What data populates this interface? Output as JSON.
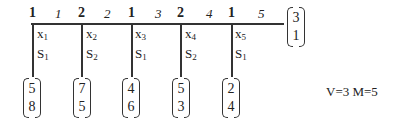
{
  "diagram": {
    "nodes": [
      {
        "label": "1",
        "x": 33
      },
      {
        "label": "2",
        "x": 82
      },
      {
        "label": "1",
        "x": 132
      },
      {
        "label": "2",
        "x": 181
      },
      {
        "label": "1",
        "x": 232
      }
    ],
    "edge_labels": [
      "1",
      "2",
      "3",
      "4",
      "5"
    ],
    "variables": [
      {
        "x": "x",
        "xi": "1",
        "s": "S",
        "si": "1"
      },
      {
        "x": "x",
        "xi": "2",
        "s": "S",
        "si": "2"
      },
      {
        "x": "x",
        "xi": "3",
        "s": "S",
        "si": "1"
      },
      {
        "x": "x",
        "xi": "4",
        "s": "S",
        "si": "2"
      },
      {
        "x": "x",
        "xi": "5",
        "s": "S",
        "si": "1"
      }
    ],
    "bottom_vectors": [
      {
        "top": "5",
        "bottom": "8"
      },
      {
        "top": "7",
        "bottom": "5"
      },
      {
        "top": "4",
        "bottom": "6"
      },
      {
        "top": "5",
        "bottom": "3"
      },
      {
        "top": "2",
        "bottom": "4"
      }
    ],
    "end_vector": {
      "top": "3",
      "bottom": "1"
    },
    "info": "V=3 M=5"
  }
}
